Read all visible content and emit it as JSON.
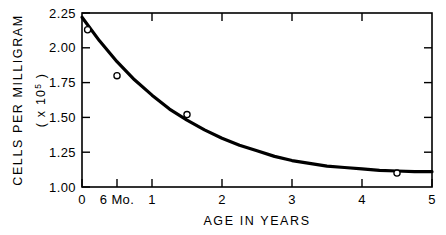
{
  "chart_data": {
    "type": "line",
    "title": "",
    "xlabel": "AGE IN YEARS",
    "ylabel_line1": "CELLS PER MILLIGRAM",
    "ylabel_line2_prefix": "( x 10",
    "ylabel_line2_exponent": "5",
    "ylabel_line2_suffix": " )",
    "xlim": [
      0,
      5
    ],
    "ylim": [
      1.0,
      2.25
    ],
    "grid": false,
    "legend": null,
    "x_ticks": [
      0,
      0.5,
      1,
      2,
      3,
      4,
      5
    ],
    "x_tick_labels": [
      "0",
      "6 Mo.",
      "1",
      "2",
      "3",
      "4",
      "5"
    ],
    "y_ticks": [
      1.0,
      1.25,
      1.5,
      1.75,
      2.0,
      2.25
    ],
    "y_tick_labels": [
      "1.00",
      "1.25",
      "1.50",
      "1.75",
      "2.00",
      "2.25"
    ],
    "series": [
      {
        "name": "fitted curve",
        "kind": "curve",
        "asymptote": 1.1,
        "x": [
          0,
          0.25,
          0.5,
          0.75,
          1,
          1.25,
          1.5,
          1.75,
          2,
          2.25,
          2.5,
          2.75,
          3,
          3.25,
          3.5,
          3.75,
          4,
          4.25,
          4.5,
          4.75,
          5
        ],
        "values": [
          2.22,
          2.05,
          1.9,
          1.77,
          1.66,
          1.56,
          1.48,
          1.41,
          1.35,
          1.3,
          1.26,
          1.22,
          1.19,
          1.17,
          1.15,
          1.14,
          1.13,
          1.12,
          1.115,
          1.11,
          1.11
        ]
      },
      {
        "name": "observed points",
        "kind": "scatter",
        "marker": "open-circle",
        "x": [
          0.08,
          0.5,
          1.5,
          4.5
        ],
        "values": [
          2.13,
          1.8,
          1.52,
          1.1
        ]
      }
    ]
  }
}
